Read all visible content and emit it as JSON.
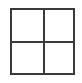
{
  "icon": {
    "name": "grid-2x2-icon",
    "color": "#3a3a3a"
  },
  "label": {
    "text": ""
  }
}
